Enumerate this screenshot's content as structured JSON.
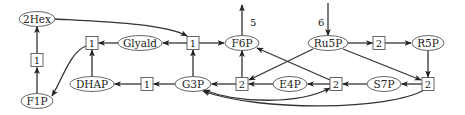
{
  "diagram": {
    "type": "metabolic-network",
    "metabolites": [
      {
        "id": "m_2hex",
        "label": "2Hex",
        "x": 37,
        "y": 19,
        "rx": 18
      },
      {
        "id": "m_f1p",
        "label": "F1P",
        "x": 37,
        "y": 101,
        "rx": 16
      },
      {
        "id": "m_glyald",
        "label": "Glyald",
        "x": 140,
        "y": 43,
        "rx": 22
      },
      {
        "id": "m_f6p",
        "label": "F6P",
        "x": 242,
        "y": 43,
        "rx": 17
      },
      {
        "id": "m_ru5p",
        "label": "Ru5P",
        "x": 328,
        "y": 43,
        "rx": 20
      },
      {
        "id": "m_r5p",
        "label": "R5P",
        "x": 428,
        "y": 43,
        "rx": 16
      },
      {
        "id": "m_dhap",
        "label": "DHAP",
        "x": 92,
        "y": 84,
        "rx": 22
      },
      {
        "id": "m_g3p",
        "label": "G3P",
        "x": 193,
        "y": 84,
        "rx": 18
      },
      {
        "id": "m_e4p",
        "label": "E4P",
        "x": 290,
        "y": 84,
        "rx": 17
      },
      {
        "id": "m_s7p",
        "label": "S7P",
        "x": 384,
        "y": 84,
        "rx": 17
      }
    ],
    "reactions": [
      {
        "id": "r_a",
        "label": "1",
        "x": 37,
        "y": 60
      },
      {
        "id": "r_b",
        "label": "1",
        "x": 92,
        "y": 43
      },
      {
        "id": "r_c",
        "label": "1",
        "x": 193,
        "y": 43
      },
      {
        "id": "r_d",
        "label": "2",
        "x": 379,
        "y": 43
      },
      {
        "id": "r_e",
        "label": "1",
        "x": 147,
        "y": 84
      },
      {
        "id": "r_f",
        "label": "2",
        "x": 242,
        "y": 84
      },
      {
        "id": "r_g",
        "label": "2",
        "x": 336,
        "y": 84
      },
      {
        "id": "r_h",
        "label": "2",
        "x": 428,
        "y": 84
      }
    ],
    "external_labels": [
      {
        "id": "out_f6p",
        "label": "5",
        "x": 252,
        "y": 25
      },
      {
        "id": "in_ru5p",
        "label": "6",
        "x": 322,
        "y": 25
      }
    ]
  }
}
